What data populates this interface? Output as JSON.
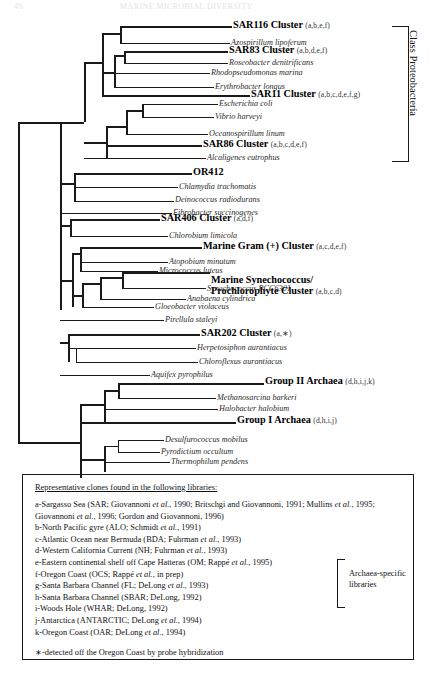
{
  "page_header": {
    "number": "46",
    "title": "MARINE MICROBIAL DIVERSITY"
  },
  "bracket": {
    "proteobacteria_label": "Class Proteobacteria"
  },
  "tree": {
    "taxa": [
      {
        "id": "sar116",
        "kind": "cluster",
        "name": "SAR116 Cluster",
        "codes": "(a,b,e,f)"
      },
      {
        "id": "azospirillum",
        "kind": "species",
        "name": "Azospirillum lipoferum"
      },
      {
        "id": "sar83",
        "kind": "cluster",
        "name": "SAR83 Cluster",
        "codes": "(a,b,d,e,f)"
      },
      {
        "id": "roseobacter",
        "kind": "species",
        "name": "Roseobacter denitrificans"
      },
      {
        "id": "rhodopseud",
        "kind": "species",
        "name": "Rhodopseudomonas marina"
      },
      {
        "id": "erythrobacter",
        "kind": "species",
        "name": "Erythrobacter longus"
      },
      {
        "id": "sar11",
        "kind": "cluster",
        "name": "SAR11 Cluster",
        "codes": "(a,b,c,d,e,f,g)"
      },
      {
        "id": "ecoli",
        "kind": "species",
        "name": "Escherichia coli"
      },
      {
        "id": "vibrio",
        "kind": "species",
        "name": "Vibrio harveyi"
      },
      {
        "id": "oceanospir",
        "kind": "species",
        "name": "Oceanospirillum linum"
      },
      {
        "id": "sar86",
        "kind": "cluster",
        "name": "SAR86 Cluster",
        "codes": "(a,b,c,d,e,f)"
      },
      {
        "id": "alcaligenes",
        "kind": "species",
        "name": "Alcaligenes eutrophus"
      },
      {
        "id": "or412",
        "kind": "cluster",
        "name": "OR412",
        "codes": ""
      },
      {
        "id": "chlamydia",
        "kind": "species",
        "name": "Chlamydia trachomatis"
      },
      {
        "id": "deinococcus",
        "kind": "species",
        "name": "Deinococcus radiodurans"
      },
      {
        "id": "fibrobacter",
        "kind": "species",
        "name": "Fibrobacter succinogenes"
      },
      {
        "id": "sar406",
        "kind": "cluster",
        "name": "SAR406 Cluster",
        "codes": "(a,d,f)"
      },
      {
        "id": "chlorobium",
        "kind": "species",
        "name": "Chlorobium limicola"
      },
      {
        "id": "gram_pos",
        "kind": "cluster",
        "name": "Marine Gram (+) Cluster",
        "codes": "(a,c,d,e,f)"
      },
      {
        "id": "atopobium",
        "kind": "species",
        "name": "Atopobium minutum"
      },
      {
        "id": "micrococcus",
        "kind": "species",
        "name": "Micrococcus luteus"
      },
      {
        "id": "synecho_clu",
        "kind": "cluster",
        "name": "Marine Synechococcus/",
        "name2": "Prochlorophyte Cluster",
        "codes": "(a,b,c,d)"
      },
      {
        "id": "synechococcus",
        "kind": "species",
        "name": "Synechococcus  PCC6301"
      },
      {
        "id": "anabaena",
        "kind": "species",
        "name": "Anabaena cylindrica"
      },
      {
        "id": "gloeobacter",
        "kind": "species",
        "name": "Gloeobacter violaceus"
      },
      {
        "id": "pirellula",
        "kind": "species",
        "name": "Pirellula staleyi"
      },
      {
        "id": "sar202",
        "kind": "cluster",
        "name": "SAR202 Cluster",
        "codes": "(a,∗)"
      },
      {
        "id": "herpetosiphon",
        "kind": "species",
        "name": "Herpetosiphon aurantiacus"
      },
      {
        "id": "chloroflexus",
        "kind": "species",
        "name": "Chloroflexus aurantiacus"
      },
      {
        "id": "aquifex",
        "kind": "species",
        "name": "Aquifex pyrophilus"
      },
      {
        "id": "group2",
        "kind": "cluster",
        "name": "Group II Archaea",
        "codes": "(d,h,i,j,k)"
      },
      {
        "id": "methanosarcina",
        "kind": "species",
        "name": "Methanosarcina barkeri"
      },
      {
        "id": "halobacter",
        "kind": "species",
        "name": "Halobacter halobium"
      },
      {
        "id": "group1",
        "kind": "cluster",
        "name": "Group I Archaea",
        "codes": "(d,h,i,j)"
      },
      {
        "id": "desulfuro",
        "kind": "species",
        "name": "Desulfurococcus mobilus"
      },
      {
        "id": "pyrodictium",
        "kind": "species",
        "name": "Pyrodictium occultum"
      },
      {
        "id": "thermophilum",
        "kind": "species",
        "name": "Thermophilum pendens"
      }
    ]
  },
  "legend": {
    "title": "Representative clones found in the following libraries:",
    "entries": [
      {
        "id": "a",
        "text_a": "a-Sargasso Sea (SAR; Giovannoni ",
        "it1": "et al.",
        "text_b": ", 1990; Britschgi and Giovannoni, 1991; Mullins ",
        "it2": "et al.",
        "text_c": ", 1995; Giovannoni ",
        "it3": "et al.",
        "text_d": ", 1996; Gordon and Giovannoni, 1996)"
      },
      {
        "id": "b",
        "text_a": "b-North Pacific gyre (ALO; Schmidt ",
        "it1": "et al.",
        "text_b": ", 1991)"
      },
      {
        "id": "c",
        "text_a": "c-Atlantic Ocean near Bermuda (BDA; Fuhrman ",
        "it1": "et al.",
        "text_b": ", 1993)"
      },
      {
        "id": "d",
        "text_a": "d-Western California Current (NH; Fuhrman ",
        "it1": "et al.",
        "text_b": ", 1993)"
      },
      {
        "id": "e",
        "text_a": "e-Eastern continental shelf off Cape Hatteras (OM; Rappé ",
        "it1": "et al.",
        "text_b": ", 1995)"
      },
      {
        "id": "f",
        "text_a": "f-Oregon Coast (OCS; Rappé ",
        "it1": "et al.",
        "text_b": ", in prep)"
      },
      {
        "id": "g",
        "text_a": "g-Santa Barbara Channel (FL; DeLong ",
        "it1": "et al.",
        "text_b": ", 1993)"
      },
      {
        "id": "h",
        "text_a": "h-Santa Barbara Channel (SBAR; DeLong, 1992)",
        "it1": "",
        "text_b": ""
      },
      {
        "id": "i",
        "text_a": "i-Woods Hole (WHAR; DeLong, 1992)",
        "it1": "",
        "text_b": ""
      },
      {
        "id": "j",
        "text_a": "j-Antarctica (ANTARCTIC; DeLong ",
        "it1": "et al.",
        "text_b": ", 1994)"
      },
      {
        "id": "k",
        "text_a": "k-Oregon Coast (OAR; DeLong ",
        "it1": "et al.",
        "text_b": ", 1994)"
      }
    ],
    "archaea_bracket_label_line1": "Archaea-specific",
    "archaea_bracket_label_line2": "libraries",
    "note": "∗-detected off the Oregon Coast by probe hybridization"
  }
}
